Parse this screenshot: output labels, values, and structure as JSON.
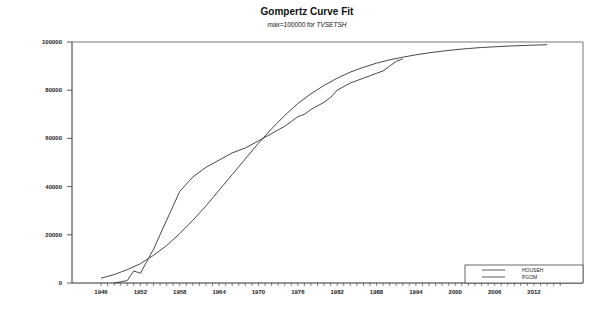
{
  "chart_data": {
    "type": "line",
    "title": "Gompertz Curve Fit",
    "subtitle": "max=100000 for TVSETSH",
    "xlabel": "",
    "ylabel": "",
    "xlim": [
      1944,
      2020
    ],
    "ylim": [
      0,
      100000
    ],
    "x_ticks": [
      1946,
      1952,
      1958,
      1964,
      1970,
      1976,
      1982,
      1988,
      1994,
      2000,
      2006,
      2012
    ],
    "y_ticks": [
      0,
      20000,
      40000,
      60000,
      80000,
      100000
    ],
    "y_tick_labels": [
      "0",
      "20000",
      "40000",
      "60000",
      "80000",
      "100000"
    ],
    "grid": false,
    "legend_position": "bottom-right",
    "series": [
      {
        "name": "HOUSEH",
        "x": [
          1948,
          1949,
          1950,
          1951,
          1952,
          1953,
          1954,
          1955,
          1956,
          1957,
          1958,
          1959,
          1960,
          1962,
          1964,
          1966,
          1968,
          1970,
          1972,
          1974,
          1975,
          1976,
          1977,
          1978,
          1980,
          1981,
          1982,
          1984,
          1986,
          1988,
          1989,
          1990,
          1991,
          1992
        ],
        "values": [
          0,
          500,
          1000,
          5000,
          4000,
          9000,
          14000,
          20000,
          26000,
          32000,
          38000,
          41000,
          44000,
          48000,
          51000,
          54000,
          56000,
          59000,
          62000,
          65000,
          67000,
          69000,
          70000,
          72000,
          75000,
          77000,
          80000,
          83000,
          85000,
          87000,
          88000,
          90000,
          92000,
          93000
        ]
      },
      {
        "name": "PGOM",
        "x": [
          1946,
          1948,
          1950,
          1952,
          1954,
          1956,
          1958,
          1960,
          1962,
          1964,
          1966,
          1968,
          1970,
          1972,
          1974,
          1976,
          1978,
          1980,
          1982,
          1984,
          1986,
          1988,
          1990,
          1992,
          1994,
          1996,
          1998,
          2000,
          2002,
          2004,
          2006,
          2008,
          2010,
          2012,
          2014
        ],
        "values": [
          2000,
          3500,
          5500,
          8000,
          11500,
          15500,
          20500,
          26000,
          32000,
          38500,
          45000,
          51500,
          58000,
          64000,
          69500,
          74500,
          78500,
          82000,
          85000,
          87500,
          89500,
          91200,
          92600,
          93700,
          94700,
          95500,
          96200,
          96800,
          97300,
          97700,
          98000,
          98300,
          98500,
          98700,
          98900
        ]
      }
    ]
  }
}
